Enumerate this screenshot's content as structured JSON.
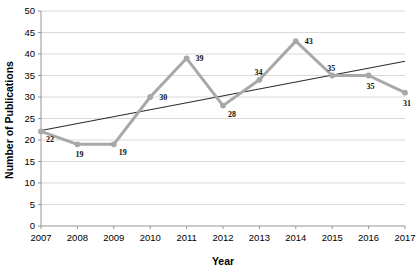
{
  "chart_data": {
    "type": "line",
    "title": "",
    "xlabel": "Year",
    "ylabel": "Number of Publications",
    "categories": [
      "2007",
      "2008",
      "2009",
      "2010",
      "2011",
      "2012",
      "2013",
      "2014",
      "2015",
      "2016",
      "2017"
    ],
    "x": [
      2007,
      2008,
      2009,
      2010,
      2011,
      2012,
      2013,
      2014,
      2015,
      2016,
      2017
    ],
    "series": [
      {
        "name": "Number of Publications",
        "type": "line",
        "color": "#a8a8a8",
        "marker": "circle",
        "values": [
          22,
          19,
          19,
          30,
          39,
          28,
          34,
          43,
          35,
          35,
          31
        ],
        "data_labels": [
          "22",
          "19",
          "19",
          "30",
          "39",
          "28",
          "34",
          "43",
          "35",
          "35",
          "31"
        ],
        "label_positions": [
          "below-right",
          "below",
          "below-right",
          "right",
          "right",
          "below-right",
          "above-left",
          "right",
          "above-left",
          "below",
          "below"
        ]
      },
      {
        "name": "Linear trendline",
        "type": "trendline",
        "color": "#2b2b2b",
        "endpoints": [
          22.2,
          38.3
        ]
      }
    ],
    "xlim": [
      2007,
      2017
    ],
    "ylim": [
      0,
      50
    ],
    "ytick_step": 5,
    "ytick_labels": [
      "0",
      "5",
      "10",
      "15",
      "20",
      "25",
      "30",
      "35",
      "40",
      "45",
      "50"
    ],
    "xtick_labels": [
      "2007",
      "2008",
      "2009",
      "2010",
      "2011",
      "2012",
      "2013",
      "2014",
      "2015",
      "2016",
      "2017"
    ],
    "grid": "horizontal",
    "grid_color": "#c9c9c9",
    "legend": "none",
    "background": "#ffffff"
  }
}
